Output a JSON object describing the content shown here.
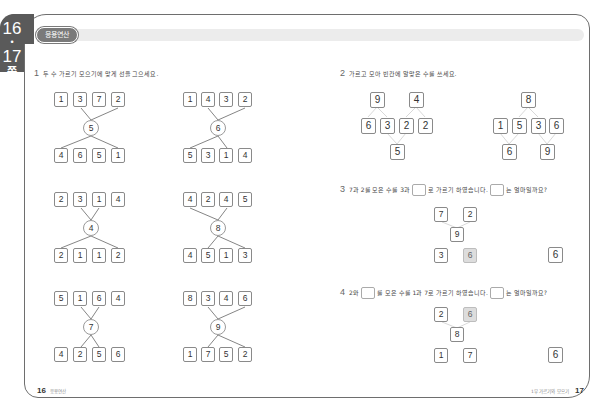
{
  "side_tab": {
    "page_a": "16",
    "dot": "•",
    "page_b": "17",
    "suffix": "쪽"
  },
  "header": {
    "section_label": "응용연산"
  },
  "problem1": {
    "number": "1",
    "instruction": "두 수 가르기 모으기에 맞게 선을 그으세요.",
    "diagrams": [
      {
        "top": [
          "1",
          "3",
          "7",
          "2"
        ],
        "center": "5",
        "bottom": [
          "4",
          "6",
          "5",
          "1"
        ]
      },
      {
        "top": [
          "1",
          "4",
          "3",
          "2"
        ],
        "center": "6",
        "bottom": [
          "5",
          "3",
          "1",
          "4"
        ]
      },
      {
        "top": [
          "2",
          "3",
          "1",
          "4"
        ],
        "center": "4",
        "bottom": [
          "2",
          "1",
          "1",
          "2"
        ]
      },
      {
        "top": [
          "4",
          "2",
          "4",
          "5"
        ],
        "center": "8",
        "bottom": [
          "4",
          "5",
          "1",
          "3"
        ]
      },
      {
        "top": [
          "5",
          "1",
          "6",
          "4"
        ],
        "center": "7",
        "bottom": [
          "4",
          "2",
          "5",
          "6"
        ]
      },
      {
        "top": [
          "8",
          "3",
          "4",
          "6"
        ],
        "center": "9",
        "bottom": [
          "1",
          "7",
          "5",
          "2"
        ]
      }
    ]
  },
  "problem2": {
    "number": "2",
    "instruction": "가르고 모아 빈칸에 알맞은 수를 쓰세요.",
    "left": {
      "top": [
        "9",
        "4"
      ],
      "middle": [
        "6",
        "3",
        "2",
        "2"
      ],
      "bottom": [
        "5"
      ]
    },
    "right": {
      "top": [
        "8"
      ],
      "middle": [
        "1",
        "5",
        "3",
        "6"
      ],
      "bottom": [
        "6",
        "9"
      ]
    }
  },
  "problem3": {
    "number": "3",
    "text_a": "7과 2를 모은 수를 3과",
    "text_b": "로 가르기 하였습니다.",
    "text_c": "는 얼마일까요?",
    "top": [
      "7",
      "2"
    ],
    "center": "9",
    "bottom": [
      "3",
      "6"
    ],
    "answer": "6"
  },
  "problem4": {
    "number": "4",
    "text_a": "2와",
    "text_b": "를 모은 수를 1과 7로 가르기 하였습니다.",
    "text_c": "는 얼마일까요?",
    "top": [
      "2",
      "6"
    ],
    "center": "8",
    "bottom": [
      "1",
      "7"
    ],
    "answer": "6"
  },
  "footer": {
    "left_page": "16",
    "left_label": "응용연산",
    "right_label": "1부 가르기와 모으기",
    "right_page": "17"
  }
}
